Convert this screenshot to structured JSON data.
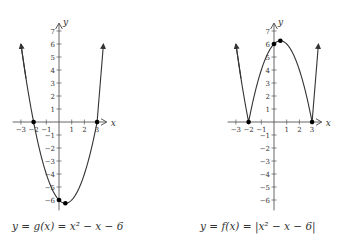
{
  "chart_data": [
    {
      "type": "line",
      "title": "y = g(x) = x^2 - x - 6",
      "caption": "y = g(x) = x² − x − 6",
      "function": "x^2 - x - 6",
      "xlabel": "x",
      "ylabel": "y",
      "xlim": [
        -3.5,
        3.5
      ],
      "ylim": [
        -6.8,
        7.5
      ],
      "x_ticks": [
        -3,
        -2,
        -1,
        1,
        2,
        3
      ],
      "y_ticks": [
        -6,
        -5,
        -4,
        -3,
        -2,
        -1,
        1,
        2,
        3,
        4,
        5,
        6,
        7
      ],
      "grid": false,
      "x": [
        -3.0,
        -2.5,
        -2.0,
        -1.5,
        -1.0,
        -0.5,
        0.0,
        0.5,
        1.0,
        1.5,
        2.0,
        2.5,
        3.0
      ],
      "values": [
        6.0,
        2.75,
        0.0,
        -2.25,
        -4.0,
        -5.25,
        -6.0,
        -6.25,
        -6.0,
        -5.25,
        -4.0,
        -2.25,
        0.0
      ],
      "marked_points": [
        {
          "x": -2,
          "y": 0,
          "label": "root"
        },
        {
          "x": 3,
          "y": 0,
          "label": "root"
        },
        {
          "x": 0,
          "y": -6,
          "label": "y-intercept"
        },
        {
          "x": 0.5,
          "y": -6.25,
          "label": "vertex"
        }
      ],
      "endpoints_arrows": [
        {
          "x": -3,
          "y": 6
        },
        {
          "x": 4,
          "y": 6
        }
      ]
    },
    {
      "type": "line",
      "title": "y = f(x) = |x^2 - x - 6|",
      "caption": "y = f(x) = |x² − x − 6|",
      "function": "|x^2 - x - 6|",
      "xlabel": "x",
      "ylabel": "y",
      "xlim": [
        -3.5,
        3.5
      ],
      "ylim": [
        -6.8,
        7.5
      ],
      "x_ticks": [
        -3,
        -2,
        -1,
        1,
        2,
        3
      ],
      "y_ticks": [
        -6,
        -5,
        -4,
        -3,
        -2,
        -1,
        1,
        2,
        3,
        4,
        5,
        6,
        7
      ],
      "grid": false,
      "x": [
        -3.0,
        -2.5,
        -2.0,
        -1.5,
        -1.0,
        -0.5,
        0.0,
        0.5,
        1.0,
        1.5,
        2.0,
        2.5,
        3.0
      ],
      "values": [
        6.0,
        2.75,
        0.0,
        2.25,
        4.0,
        5.25,
        6.0,
        6.25,
        6.0,
        5.25,
        4.0,
        2.25,
        0.0
      ],
      "marked_points": [
        {
          "x": -2,
          "y": 0,
          "label": "root"
        },
        {
          "x": 3,
          "y": 0,
          "label": "root"
        },
        {
          "x": 0,
          "y": 6,
          "label": "y-intercept"
        },
        {
          "x": 0.5,
          "y": 6.25,
          "label": "local max"
        }
      ],
      "endpoints_arrows": [
        {
          "x": -3,
          "y": 6
        },
        {
          "x": 4,
          "y": 6
        }
      ]
    }
  ],
  "graphs": {
    "left": {
      "caption": "y = g(x) = x² − x − 6",
      "x_axis_label": "x",
      "y_axis_label": "y",
      "x_tick_labels": [
        "−3",
        "−2",
        "−1",
        "1",
        "2",
        "3"
      ],
      "y_tick_labels": [
        "7",
        "6",
        "5",
        "4",
        "3",
        "2",
        "1",
        "−1",
        "−2",
        "−3",
        "−4",
        "−5",
        "−6"
      ]
    },
    "right": {
      "caption": "y = f(x) = |x² − x − 6|",
      "x_axis_label": "x",
      "y_axis_label": "y",
      "x_tick_labels": [
        "−3",
        "−2",
        "−1",
        "1",
        "2",
        "3"
      ],
      "y_tick_labels": [
        "7",
        "6",
        "5",
        "4",
        "3",
        "2",
        "1",
        "−1",
        "−2",
        "−3",
        "−4",
        "−5",
        "−6"
      ]
    }
  },
  "colors": {
    "curve": "#333333",
    "axis": "#555555",
    "point": "#000000",
    "background": "#ffffff"
  }
}
